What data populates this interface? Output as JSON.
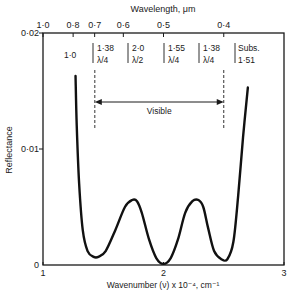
{
  "chart_data": {
    "type": "line",
    "title": "",
    "xlabel": "Wavenumber (ν) x 10⁻⁴, cm⁻¹",
    "ylabel": "Reflectance",
    "top_xlabel": "Wavelength, μm",
    "xlim": [
      1,
      3
    ],
    "ylim": [
      0,
      0.02
    ],
    "grid": false,
    "x_ticks": [
      {
        "value": 1,
        "label": "1"
      },
      {
        "value": 2,
        "label": "2"
      },
      {
        "value": 3,
        "label": "3"
      }
    ],
    "y_ticks": [
      {
        "value": 0,
        "label": "0"
      },
      {
        "value": 0.01,
        "label": "0·01"
      },
      {
        "value": 0.02,
        "label": "0·02"
      }
    ],
    "top_ticks": [
      {
        "value": 1.0,
        "label": "1·0"
      },
      {
        "value": 1.25,
        "label": "0·8"
      },
      {
        "value": 1.4286,
        "label": "0·7"
      },
      {
        "value": 1.6667,
        "label": "0·6"
      },
      {
        "value": 2.0,
        "label": "0·5"
      },
      {
        "value": 2.5,
        "label": "0·4"
      }
    ],
    "series": [
      {
        "name": "Reflectance",
        "x": [
          1.27,
          1.28,
          1.3,
          1.33,
          1.37,
          1.42,
          1.46,
          1.52,
          1.6,
          1.68,
          1.74,
          1.78,
          1.82,
          1.88,
          1.94,
          2.0,
          2.06,
          2.12,
          2.18,
          2.24,
          2.29,
          2.33,
          2.37,
          2.42,
          2.48,
          2.53,
          2.58,
          2.62,
          2.66,
          2.7
        ],
        "y": [
          0.0163,
          0.012,
          0.007,
          0.003,
          0.0012,
          0.0007,
          0.0007,
          0.0012,
          0.003,
          0.005,
          0.0056,
          0.0055,
          0.0045,
          0.0022,
          0.0006,
          0.0001,
          0.0006,
          0.0022,
          0.0045,
          0.0055,
          0.0056,
          0.005,
          0.0032,
          0.0012,
          0.0005,
          0.0005,
          0.002,
          0.006,
          0.011,
          0.0153
        ]
      }
    ],
    "annotations": {
      "layers": [
        {
          "line1": "1·0",
          "line2": ""
        },
        {
          "line1": "1·38",
          "line2": "λ/4"
        },
        {
          "line1": "2·0",
          "line2": "λ/2"
        },
        {
          "line1": "1·55",
          "line2": "λ/4"
        },
        {
          "line1": "1·38",
          "line2": "λ/4"
        },
        {
          "line1": "Subs.",
          "line2": "1·51"
        }
      ],
      "visible_label": "Visible",
      "visible_range": [
        1.43,
        2.5
      ]
    }
  }
}
